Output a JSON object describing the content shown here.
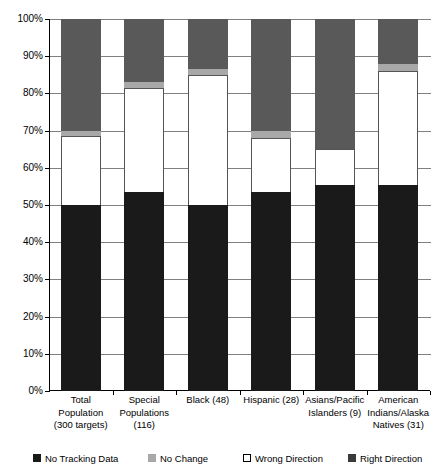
{
  "chart_data": {
    "type": "bar",
    "subtype": "stacked-bar-100-percent",
    "title": "",
    "xlabel": "",
    "ylabel": "",
    "ylim": [
      0,
      100
    ],
    "yunit": "%",
    "grid": true,
    "legend_position": "bottom",
    "categories": [
      "Total Population (300 targets)",
      "Special Populations (116)",
      "Black (48)",
      "Hispanic (28)",
      "Asians/Pacific Islanders (9)",
      "American Indians/Alaska Natives (31)"
    ],
    "category_lines": [
      [
        "Total",
        "Population",
        "(300 targets)"
      ],
      [
        "Special",
        "Populations",
        "(116)"
      ],
      [
        "Black (48)"
      ],
      [
        "Hispanic (28)"
      ],
      [
        "Asians/Pacific",
        "Islanders (9)"
      ],
      [
        "American",
        "Indians/Alaska",
        "Natives (31)"
      ]
    ],
    "ytick_labels": [
      "0%",
      "10%",
      "20%",
      "30%",
      "40%",
      "50%",
      "60%",
      "70%",
      "80%",
      "90%",
      "100%"
    ],
    "ytick_values": [
      0,
      10,
      20,
      30,
      40,
      50,
      60,
      70,
      80,
      90,
      100
    ],
    "series": [
      {
        "name": "Right Direction",
        "color": "#1a1a1a",
        "values": [
          50,
          53.5,
          50,
          53.5,
          55.5,
          55.5
        ]
      },
      {
        "name": "Wrong Direction",
        "color": "#ffffff",
        "values": [
          18.5,
          28,
          35,
          14.5,
          9.5,
          30.5
        ]
      },
      {
        "name": "No Change",
        "color": "#a8a8a8",
        "values": [
          1.5,
          1.5,
          1.5,
          2,
          0,
          2
        ]
      },
      {
        "name": "No Tracking Data",
        "color": "#595959",
        "values": [
          30,
          17,
          13.5,
          30,
          35,
          12
        ]
      }
    ]
  },
  "legend": {
    "items": [
      {
        "label": "No Tracking Data",
        "swatch": "no-tracking"
      },
      {
        "label": "No Change",
        "swatch": "no-change"
      },
      {
        "label": "Wrong Direction",
        "swatch": "wrong"
      },
      {
        "label": "Right Direction",
        "swatch": "right"
      }
    ]
  }
}
